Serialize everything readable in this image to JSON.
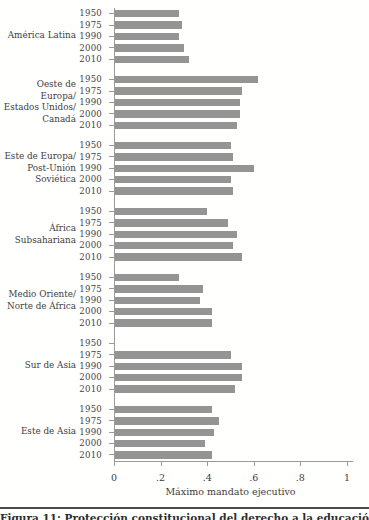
{
  "figure": {
    "caption": "Figura 11: Protección constitucional del derecho a la educación"
  },
  "chart_data": {
    "type": "bar",
    "orientation": "horizontal",
    "title": "",
    "xlabel": "Máximo mandato ejecutivo",
    "ylabel": "",
    "xlim": [
      0,
      1
    ],
    "xticks": [
      {
        "label": "0",
        "value": 0
      },
      {
        "label": ".2",
        "value": 0.2
      },
      {
        "label": ".4",
        "value": 0.4
      },
      {
        "label": ".6",
        "value": 0.6
      },
      {
        "label": ".8",
        "value": 0.8
      },
      {
        "label": "1",
        "value": 1
      }
    ],
    "years": [
      "1950",
      "1975",
      "1990",
      "2000",
      "2010"
    ],
    "bar_color": "#949494",
    "grid": false,
    "legend": "none",
    "groups": [
      {
        "label_lines": [
          "América Latina"
        ],
        "values": [
          0.28,
          0.29,
          0.28,
          0.3,
          0.32
        ]
      },
      {
        "label_lines": [
          "Oeste de Europa/",
          "Estados Unidos/",
          "Canadá"
        ],
        "values": [
          0.62,
          0.55,
          0.54,
          0.54,
          0.53
        ]
      },
      {
        "label_lines": [
          "Este de Europa/",
          "Post-Unión",
          "Soviética"
        ],
        "values": [
          0.5,
          0.51,
          0.6,
          0.5,
          0.51
        ]
      },
      {
        "label_lines": [
          "África",
          "Subsahariana"
        ],
        "values": [
          0.4,
          0.49,
          0.53,
          0.51,
          0.55
        ]
      },
      {
        "label_lines": [
          "Medio Oriente/",
          "Norte de África"
        ],
        "values": [
          0.28,
          0.38,
          0.37,
          0.42,
          0.42
        ]
      },
      {
        "label_lines": [
          "Sur de Asia"
        ],
        "values": [
          0,
          0.5,
          0.55,
          0.55,
          0.52
        ]
      },
      {
        "label_lines": [
          "Este de Asia"
        ],
        "values": [
          0.42,
          0.45,
          0.43,
          0.39,
          0.42
        ]
      }
    ]
  }
}
